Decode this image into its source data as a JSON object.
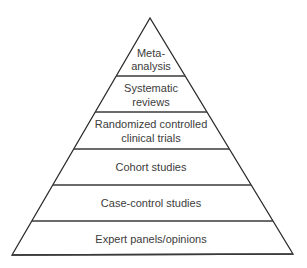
{
  "diagram": {
    "type": "pyramid",
    "title": "",
    "levels": [
      {
        "lines": [
          "Meta-",
          "analysis"
        ]
      },
      {
        "lines": [
          "Systematic",
          "reviews"
        ]
      },
      {
        "lines": [
          "Randomized controlled",
          "clinical trials"
        ]
      },
      {
        "lines": [
          "Cohort studies"
        ]
      },
      {
        "lines": [
          "Case-control studies"
        ]
      },
      {
        "lines": [
          "Expert panels/opinions"
        ]
      }
    ],
    "colors": {
      "stroke": "#2a2a2a",
      "text": "#3c3c3c",
      "background": "#ffffff"
    }
  }
}
